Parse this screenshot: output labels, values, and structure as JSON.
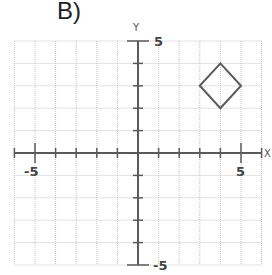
{
  "figure": {
    "label": "B)",
    "x_axis_label": "X",
    "y_axis_label": "Y",
    "tick_labels": {
      "x_min": "-5",
      "x_max": "5",
      "y_max": "5",
      "y_min": "-5"
    }
  },
  "chart_data": {
    "type": "scatter",
    "title": "B)",
    "xlabel": "X",
    "ylabel": "Y",
    "xlim": [
      -6,
      6
    ],
    "ylim": [
      -5,
      5
    ],
    "grid": true,
    "tick_labels": {
      "x": [
        "-5",
        "5"
      ],
      "y": [
        "5",
        "-5"
      ]
    },
    "shapes": [
      {
        "name": "diamond",
        "type": "polygon",
        "vertices": [
          [
            4,
            4
          ],
          [
            5,
            3
          ],
          [
            4,
            2
          ],
          [
            3,
            3
          ]
        ]
      }
    ]
  },
  "colors": {
    "grid": "#bdbdbd",
    "axis": "#555555",
    "shape": "#5a5a5a"
  }
}
